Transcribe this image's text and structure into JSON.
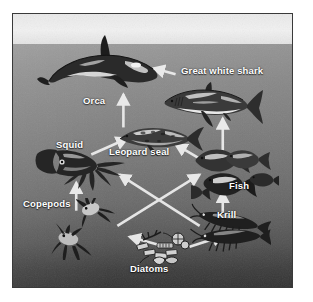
{
  "figure": {
    "type": "food-web-diagram",
    "background": {
      "sky_color": "#eeeeee",
      "water_top_color": "#9a9a9a",
      "water_bottom_color": "#343434",
      "frame_border_color": "#3a3a3a",
      "arrow_color": "#f0f0f0",
      "label_color": "#ffffff"
    }
  },
  "organisms": [
    {
      "id": "orca",
      "label": "Orca",
      "trophic_level": "apex predator"
    },
    {
      "id": "great-white-shark",
      "label": "Great white shark",
      "trophic_level": "apex predator"
    },
    {
      "id": "leopard-seal",
      "label": "Leopard seal",
      "trophic_level": "secondary consumer"
    },
    {
      "id": "squid",
      "label": "Squid",
      "trophic_level": "secondary consumer"
    },
    {
      "id": "fish",
      "label": "Fish",
      "trophic_level": "secondary consumer"
    },
    {
      "id": "copepods",
      "label": "Copepods",
      "trophic_level": "primary consumer"
    },
    {
      "id": "krill",
      "label": "Krill",
      "trophic_level": "primary consumer"
    },
    {
      "id": "diatoms",
      "label": "Diatoms",
      "trophic_level": "producer"
    }
  ],
  "labels": {
    "orca": "Orca",
    "great_white_shark": "Great white shark",
    "leopard_seal": "Leopard seal",
    "squid": "Squid",
    "fish": "Fish",
    "copepods": "Copepods",
    "krill": "Krill",
    "diatoms": "Diatoms"
  },
  "arrows": [
    {
      "from": "diatoms",
      "to": "copepods"
    },
    {
      "from": "diatoms",
      "to": "krill"
    },
    {
      "from": "copepods",
      "to": "squid"
    },
    {
      "from": "copepods",
      "to": "fish"
    },
    {
      "from": "krill",
      "to": "fish"
    },
    {
      "from": "krill",
      "to": "squid"
    },
    {
      "from": "squid",
      "to": "leopard-seal"
    },
    {
      "from": "fish",
      "to": "leopard-seal"
    },
    {
      "from": "fish",
      "to": "great-white-shark"
    },
    {
      "from": "leopard-seal",
      "to": "orca"
    },
    {
      "from": "great-white-shark",
      "to": "orca"
    }
  ]
}
